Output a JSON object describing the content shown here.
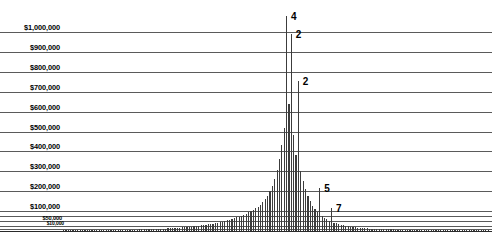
{
  "chart_data": {
    "type": "bar",
    "title": "",
    "subtitle": "",
    "xlabel": "",
    "ylabel": "",
    "grid": true,
    "legend": false,
    "legend_position": "none",
    "ylim": [
      0,
      1080000
    ],
    "y_axis_ticks": [
      {
        "label": "$1,000,000",
        "value": 1000000,
        "size": "major"
      },
      {
        "label": "$900,000",
        "value": 900000,
        "size": "major"
      },
      {
        "label": "$800,000",
        "value": 800000,
        "size": "major"
      },
      {
        "label": "$700,000",
        "value": 700000,
        "size": "major"
      },
      {
        "label": "$600,000",
        "value": 600000,
        "size": "major"
      },
      {
        "label": "$500,000",
        "value": 500000,
        "size": "major"
      },
      {
        "label": "$400,000",
        "value": 400000,
        "size": "major"
      },
      {
        "label": "$300,000",
        "value": 300000,
        "size": "major"
      },
      {
        "label": "$200,000",
        "value": 200000,
        "size": "major"
      },
      {
        "label": "$100,000",
        "value": 100000,
        "size": "major"
      },
      {
        "label": "$50,000",
        "value": 50000,
        "size": "minor"
      },
      {
        "label": "$10,000",
        "value": 25000,
        "size": "tiny"
      }
    ],
    "extra_gridlines": [
      75000,
      12000,
      0
    ],
    "bar_color": "#3c3c3c",
    "gridline_color": "#5a5a5a",
    "annotations": [
      {
        "text": "4",
        "value": 1080000,
        "x_index": 94,
        "note": "peak-bar-label-clipped-top"
      },
      {
        "text": "2",
        "value": 990000,
        "x_index": 96,
        "note": "tallest-spike-label"
      },
      {
        "text": "2",
        "value": 755000,
        "x_index": 99,
        "note": "second-spike-label"
      },
      {
        "text": "5",
        "value": 215000,
        "x_index": 108,
        "note": "mid-tail-label"
      },
      {
        "text": "7",
        "value": 118000,
        "x_index": 113,
        "note": "lower-tail-label"
      }
    ],
    "values": [
      2000,
      2200,
      2400,
      2300,
      2600,
      2800,
      2700,
      3000,
      3200,
      3100,
      3400,
      3600,
      3500,
      3800,
      4000,
      4200,
      4100,
      4400,
      4600,
      4800,
      5000,
      5200,
      5400,
      5300,
      5600,
      5900,
      6100,
      6400,
      6600,
      6900,
      7200,
      7500,
      7800,
      8100,
      8400,
      8800,
      9200,
      9600,
      10000,
      10500,
      11000,
      11500,
      12000,
      12600,
      13200,
      13900,
      14600,
      15400,
      16200,
      17100,
      18000,
      19000,
      20000,
      21200,
      22400,
      23700,
      25100,
      26600,
      28200,
      29900,
      31700,
      33600,
      35600,
      37700,
      40000,
      42400,
      45000,
      47700,
      50600,
      53700,
      57000,
      60500,
      64200,
      68200,
      72400,
      77000,
      82000,
      87400,
      93200,
      99500,
      106000,
      114000,
      123000,
      133000,
      145000,
      160000,
      178000,
      200000,
      228000,
      262000,
      305000,
      360000,
      430000,
      520000,
      1080000,
      640000,
      990000,
      480000,
      380000,
      755000,
      300000,
      250000,
      210000,
      175000,
      150000,
      128000,
      112000,
      98000,
      215000,
      74000,
      65000,
      58000,
      52000,
      118000,
      42000,
      38000,
      34000,
      31000,
      28000,
      25500,
      23000,
      21000,
      19500,
      18000,
      16500,
      15500,
      14500,
      13500,
      12800,
      12000,
      11400,
      10800,
      10300,
      9800,
      9400,
      9000,
      8600,
      8300,
      8000,
      7700,
      7400,
      7200,
      7000,
      6800,
      6600,
      6400,
      6200,
      6100,
      5900,
      5800,
      5600,
      5500,
      5400,
      5300,
      5200,
      5100,
      5000,
      4900,
      4800,
      4700,
      4600,
      4550,
      4500,
      4450,
      4400,
      4350,
      4300,
      4250,
      4200,
      4150,
      4100,
      4050,
      4000,
      3950,
      3900,
      3880,
      3850,
      3820,
      3800,
      3780
    ]
  }
}
